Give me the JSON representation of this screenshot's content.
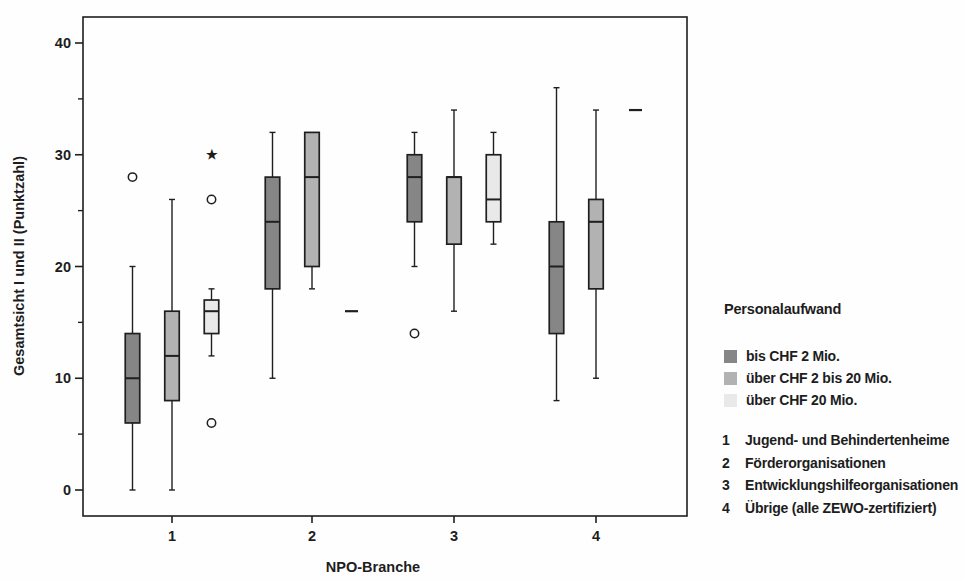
{
  "chart_data": {
    "type": "boxplot",
    "xlabel": "NPO-Branche",
    "ylabel": "Gesamtsicht I und II (Punktzahl)",
    "y_axis": {
      "min": 0,
      "max": 40,
      "major_ticks": [
        0,
        10,
        20,
        30,
        40
      ],
      "minor_ticks": [
        5,
        15,
        25,
        35
      ]
    },
    "categories": [
      "1",
      "2",
      "3",
      "4"
    ],
    "series": [
      {
        "name": "bis CHF 2 Mio.",
        "color": "#868686",
        "boxes": [
          {
            "category": "1",
            "min": 0,
            "q1": 6,
            "median": 10,
            "q3": 14,
            "max": 20,
            "outliers": [
              {
                "value": 28,
                "marker": "circle"
              }
            ]
          },
          {
            "category": "2",
            "min": 10,
            "q1": 18,
            "median": 24,
            "q3": 28,
            "max": 32,
            "outliers": []
          },
          {
            "category": "3",
            "min": 20,
            "q1": 24,
            "median": 28,
            "q3": 30,
            "max": 32,
            "outliers": [
              {
                "value": 14,
                "marker": "circle"
              }
            ]
          },
          {
            "category": "4",
            "min": 8,
            "q1": 14,
            "median": 20,
            "q3": 24,
            "max": 36,
            "outliers": []
          }
        ]
      },
      {
        "name": "über CHF 2 bis 20 Mio.",
        "color": "#b2b2b2",
        "boxes": [
          {
            "category": "1",
            "min": 0,
            "q1": 8,
            "median": 12,
            "q3": 16,
            "max": 26,
            "outliers": []
          },
          {
            "category": "2",
            "min": 18,
            "q1": 20,
            "median": 28,
            "q3": 32,
            "max": 32,
            "outliers": []
          },
          {
            "category": "3",
            "min": 16,
            "q1": 22,
            "median": 28,
            "q3": 28,
            "max": 34,
            "outliers": []
          },
          {
            "category": "4",
            "min": 10,
            "q1": 18,
            "median": 24,
            "q3": 26,
            "max": 34,
            "outliers": []
          }
        ]
      },
      {
        "name": "über CHF 20 Mio.",
        "color": "#e9e9e9",
        "boxes": [
          {
            "category": "1",
            "min": 12,
            "q1": 14,
            "median": 16,
            "q3": 17,
            "max": 18,
            "outliers": [
              {
                "value": 6,
                "marker": "circle"
              },
              {
                "value": 26,
                "marker": "circle"
              },
              {
                "value": 30,
                "marker": "star"
              }
            ]
          },
          {
            "category": "2",
            "value": 16
          },
          {
            "category": "3",
            "min": 22,
            "q1": 24,
            "median": 26,
            "q3": 30,
            "max": 32,
            "outliers": []
          },
          {
            "category": "4",
            "value": 34
          }
        ]
      }
    ],
    "legend": {
      "title": "Personalaufwand",
      "position": "right"
    },
    "category_key": [
      {
        "number": "1",
        "label": "Jugend- und Behindertenheime"
      },
      {
        "number": "2",
        "label": "Förderorganisationen"
      },
      {
        "number": "3",
        "label": "Entwicklungshilfeorganisationen"
      },
      {
        "number": "4",
        "label": "Übrige (alle ZEWO-zertifiziert)"
      }
    ]
  },
  "colors": {
    "ink": "#1f1f1f",
    "paper": "#fefefe"
  }
}
